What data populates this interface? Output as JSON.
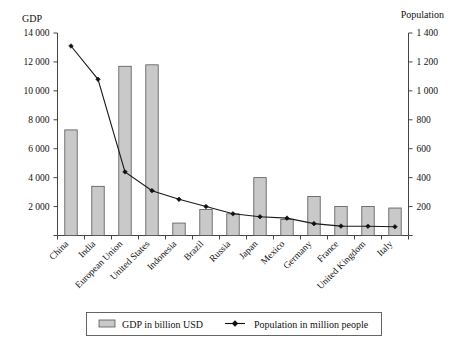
{
  "chart_data": {
    "type": "bar",
    "title": "",
    "subtitle": "",
    "categories": [
      "China",
      "India",
      "European Union",
      "United States",
      "Indonesia",
      "Brazil",
      "Russia",
      "Japan",
      "Mexico",
      "Germany",
      "France",
      "United Kingdom",
      "Italy"
    ],
    "series": [
      {
        "name": "GDP in billion USD",
        "type": "bar",
        "axis": "left",
        "values": [
          7300,
          3400,
          11700,
          11800,
          860,
          1800,
          1500,
          4000,
          1100,
          2700,
          2000,
          2000,
          1900
        ]
      },
      {
        "name": "Population in million people",
        "type": "line",
        "axis": "right",
        "values": [
          1310,
          1080,
          440,
          310,
          250,
          200,
          150,
          130,
          120,
          82,
          65,
          64,
          60
        ]
      }
    ],
    "xlabel": "",
    "ylabel": "GDP",
    "y2label": "Population",
    "ylim": [
      0,
      14000
    ],
    "y2lim": [
      0,
      1400
    ],
    "yticks": [
      "",
      "2 000",
      "4 000",
      "6 000",
      "8 000",
      "10 000",
      "12 000",
      "14 000"
    ],
    "y2ticks": [
      "",
      "200",
      "400",
      "600",
      "800",
      "1 000",
      "1 200",
      "1 400"
    ],
    "grid": false,
    "legend_position": "bottom",
    "legend": [
      {
        "label": "GDP in billion USD",
        "marker": "bar-swatch",
        "color": "#c9c9c9"
      },
      {
        "label": "Population in million people",
        "marker": "line-diamond",
        "color": "#111111"
      }
    ],
    "colors": {
      "bar": "#c9c9c9",
      "bar_edge": "#555555",
      "line": "#111111",
      "axis": "#444444"
    }
  },
  "axes": {
    "left_title": "GDP",
    "right_title": "Population"
  }
}
